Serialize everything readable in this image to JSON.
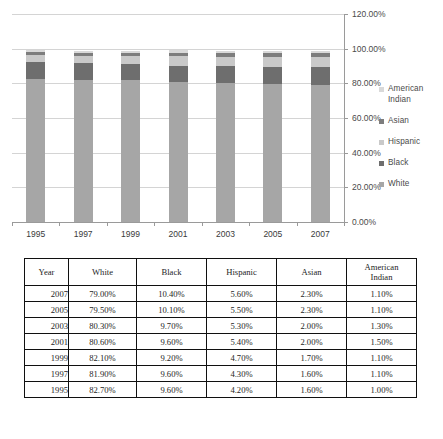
{
  "chart_data": {
    "type": "bar",
    "subtype": "stacked-column",
    "title": "",
    "xlabel": "",
    "ylabel": "",
    "categories": [
      "1995",
      "1997",
      "1999",
      "2001",
      "2003",
      "2005",
      "2007"
    ],
    "series": [
      {
        "name": "White",
        "color": "#a6a6a6",
        "values": [
          82.7,
          81.9,
          82.1,
          80.6,
          80.3,
          79.5,
          79.0
        ]
      },
      {
        "name": "Black",
        "color": "#6e6e6e",
        "values": [
          9.6,
          9.6,
          9.2,
          9.6,
          9.7,
          10.1,
          10.4
        ]
      },
      {
        "name": "Hispanic",
        "color": "#c9c9c9",
        "values": [
          4.2,
          4.3,
          4.7,
          5.4,
          5.3,
          5.5,
          5.6
        ]
      },
      {
        "name": "Asian",
        "color": "#7d7d7d",
        "values": [
          1.6,
          1.6,
          1.7,
          2.0,
          2.0,
          2.3,
          2.3
        ]
      },
      {
        "name": "American Indian",
        "color": "#d9d9d9",
        "values": [
          1.0,
          1.1,
          1.1,
          1.5,
          1.3,
          1.1,
          1.1
        ]
      }
    ],
    "ylim": [
      0,
      120
    ],
    "yticks": [
      "0.00%",
      "20.00%",
      "40.00%",
      "60.00%",
      "80.00%",
      "100.00%",
      "120.00%"
    ],
    "ytick_values": [
      0,
      20,
      40,
      60,
      80,
      100,
      120
    ],
    "grid": true,
    "legend_position": "right",
    "legend_entries": [
      "American Indian",
      "Asian",
      "Hispanic",
      "Black",
      "White"
    ],
    "units": "percent"
  },
  "legend": {
    "items": [
      {
        "label_line1": "American",
        "label_line2": "Indian",
        "color": "#d9d9d9"
      },
      {
        "label_line1": "Asian",
        "label_line2": "",
        "color": "#7d7d7d"
      },
      {
        "label_line1": "Hispanic",
        "label_line2": "",
        "color": "#c9c9c9"
      },
      {
        "label_line1": "Black",
        "label_line2": "",
        "color": "#6e6e6e"
      },
      {
        "label_line1": "White",
        "label_line2": "",
        "color": "#a6a6a6"
      }
    ]
  },
  "table": {
    "headers": [
      {
        "line1": "Year",
        "line2": ""
      },
      {
        "line1": "White",
        "line2": ""
      },
      {
        "line1": "Black",
        "line2": ""
      },
      {
        "line1": "Hispanic",
        "line2": ""
      },
      {
        "line1": "Asian",
        "line2": ""
      },
      {
        "line1": "American",
        "line2": "Indian"
      }
    ],
    "rows": [
      {
        "year": "2007",
        "white": "79.00%",
        "black": "10.40%",
        "hispanic": "5.60%",
        "asian": "2.30%",
        "american_indian": "1.10%"
      },
      {
        "year": "2005",
        "white": "79.50%",
        "black": "10.10%",
        "hispanic": "5.50%",
        "asian": "2.30%",
        "american_indian": "1.10%"
      },
      {
        "year": "2003",
        "white": "80.30%",
        "black": "9.70%",
        "hispanic": "5.30%",
        "asian": "2.00%",
        "american_indian": "1.30%"
      },
      {
        "year": "2001",
        "white": "80.60%",
        "black": "9.60%",
        "hispanic": "5.40%",
        "asian": "2.00%",
        "american_indian": "1.50%"
      },
      {
        "year": "1999",
        "white": "82.10%",
        "black": "9.20%",
        "hispanic": "4.70%",
        "asian": "1.70%",
        "american_indian": "1.10%"
      },
      {
        "year": "1997",
        "white": "81.90%",
        "black": "9.60%",
        "hispanic": "4.30%",
        "asian": "1.60%",
        "american_indian": "1.10%"
      },
      {
        "year": "1995",
        "white": "82.70%",
        "black": "9.60%",
        "hispanic": "4.20%",
        "asian": "1.60%",
        "american_indian": "1.00%"
      }
    ]
  }
}
